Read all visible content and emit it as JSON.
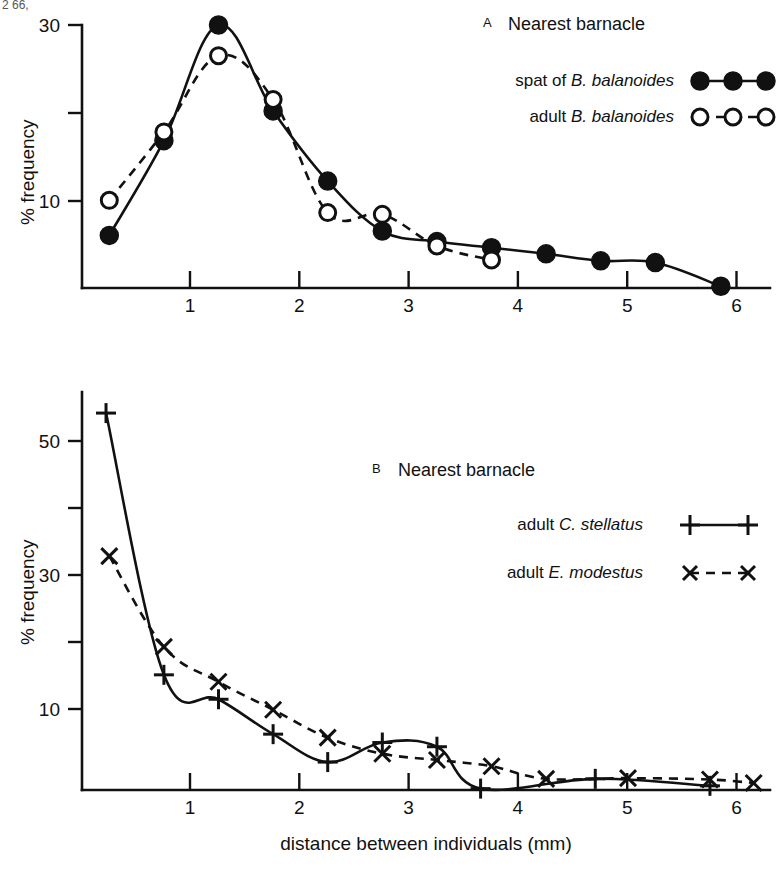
{
  "figure": {
    "top_cropped_text": "2  66,",
    "xlabel": "distance between individuals (mm)",
    "ylabel": "% frequency"
  },
  "chart_data": [
    {
      "type": "line",
      "panel": "A",
      "panel_letter": "A",
      "title": "Nearest barnacle",
      "xlabel": "",
      "ylabel": "% frequency",
      "xlim": [
        0,
        6.3
      ],
      "ylim": [
        0,
        31
      ],
      "xticks": [
        1,
        2,
        3,
        4,
        5,
        6
      ],
      "xticklabels": [
        "1",
        "2",
        "3",
        "4",
        "5",
        "6"
      ],
      "yticks": [
        10,
        20,
        30
      ],
      "yticklabels": [
        "10",
        "",
        "30"
      ],
      "grid": false,
      "legend_position": "top-right",
      "series": [
        {
          "name": "spat of B. balanoides",
          "label_plain": "spat of ",
          "label_italic": "B. balanoides",
          "marker": "filled-circle",
          "linestyle": "solid",
          "x": [
            0.25,
            0.75,
            1.25,
            1.75,
            2.25,
            2.75,
            3.25,
            3.75,
            4.25,
            4.75,
            5.25,
            5.85
          ],
          "values": [
            6.0,
            16.8,
            30.0,
            20.2,
            12.2,
            6.5,
            5.3,
            4.6,
            3.9,
            3.1,
            2.9,
            0.2
          ]
        },
        {
          "name": "adult B. balanoides",
          "label_plain": "adult ",
          "label_italic": "B. balanoides",
          "marker": "open-circle",
          "linestyle": "dashed",
          "x": [
            0.25,
            0.75,
            1.25,
            1.75,
            2.25,
            2.75,
            3.25,
            3.75
          ],
          "values": [
            10.0,
            17.8,
            26.5,
            21.5,
            8.6,
            8.4,
            4.8,
            3.2
          ]
        }
      ]
    },
    {
      "type": "line",
      "panel": "B",
      "panel_letter": "B",
      "title": "Nearest barnacle",
      "xlabel": "distance between individuals (mm)",
      "ylabel": "% frequency",
      "xlim": [
        0,
        6.3
      ],
      "ylim": [
        0,
        56
      ],
      "xticks": [
        1,
        2,
        3,
        4,
        5,
        6
      ],
      "xticklabels": [
        "1",
        "2",
        "3",
        "4",
        "5",
        "6"
      ],
      "yticks": [
        10,
        20,
        30,
        40,
        50
      ],
      "yticklabels": [
        "10",
        "",
        "30",
        "",
        "50"
      ],
      "grid": false,
      "legend_position": "top-right",
      "series": [
        {
          "name": "adult C. stellatus",
          "label_plain": "adult ",
          "label_italic": "C. stellatus",
          "marker": "plus",
          "linestyle": "solid",
          "x": [
            0.22,
            0.75,
            1.25,
            1.75,
            2.25,
            2.75,
            3.25,
            3.65,
            4.7,
            5.75
          ],
          "values": [
            54.0,
            16.5,
            13.0,
            8.0,
            4.0,
            6.8,
            6.2,
            0.2,
            1.6,
            0.6
          ]
        },
        {
          "name": "adult E. modestus",
          "label_plain": "adult ",
          "label_italic": "E. modestus",
          "marker": "cross",
          "linestyle": "dashed",
          "x": [
            0.25,
            0.75,
            1.25,
            1.75,
            2.25,
            2.75,
            3.25,
            3.75,
            4.25,
            5.0,
            5.75,
            6.15
          ],
          "values": [
            33.5,
            20.5,
            15.5,
            11.5,
            7.5,
            5.2,
            4.3,
            3.4,
            1.6,
            1.7,
            1.5,
            1.0
          ]
        }
      ]
    }
  ],
  "panel_a": {
    "letter": "A",
    "title": "Nearest barnacle",
    "legend": [
      {
        "plain": "spat of ",
        "italic": "B. balanoides",
        "marker": "filled-circle",
        "line": "solid"
      },
      {
        "plain": "adult ",
        "italic": "B. balanoides",
        "marker": "open-circle",
        "line": "dashed"
      }
    ],
    "ylabel": "% frequency",
    "yticklabels": [
      "30",
      "10"
    ],
    "xticklabels": [
      "1",
      "2",
      "3",
      "4",
      "5",
      "6"
    ]
  },
  "panel_b": {
    "letter": "B",
    "title": "Nearest barnacle",
    "legend": [
      {
        "plain": "adult ",
        "italic": "C. stellatus",
        "marker": "plus",
        "line": "solid"
      },
      {
        "plain": "adult ",
        "italic": "E. modestus",
        "marker": "cross",
        "line": "dashed"
      }
    ],
    "ylabel": "% frequency",
    "yticklabels": [
      "50",
      "30",
      "10"
    ],
    "xticklabels": [
      "1",
      "2",
      "3",
      "4",
      "5",
      "6"
    ],
    "xlabel": "distance between individuals (mm)"
  }
}
